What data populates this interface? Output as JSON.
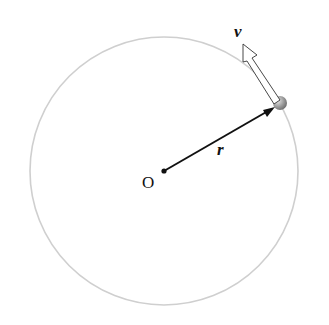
{
  "diagram": {
    "circle": {
      "cx": 164,
      "cy": 171,
      "r": 134,
      "stroke": "#c8c8c8"
    },
    "origin": {
      "label": "O",
      "x": 164,
      "y": 171
    },
    "particle": {
      "x": 278,
      "y": 104,
      "color": "#9a9a9a"
    },
    "position_vector": {
      "label": "r",
      "from": "O",
      "to": "particle"
    },
    "velocity_vector": {
      "label": "v",
      "style": "hollow-arrow",
      "direction": "tangent"
    }
  }
}
